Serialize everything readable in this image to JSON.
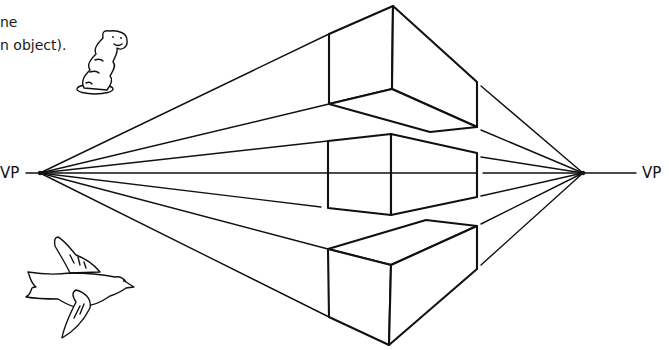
{
  "caption": {
    "line1": "ne",
    "line2": "n object)."
  },
  "vanishing_points": {
    "left_label": "VP",
    "right_label": "VP"
  },
  "figure": {
    "type": "two-point perspective drawing",
    "boxes": [
      "box above horizon",
      "box on horizon",
      "box below horizon"
    ],
    "doodles": [
      "worm",
      "bird"
    ]
  }
}
